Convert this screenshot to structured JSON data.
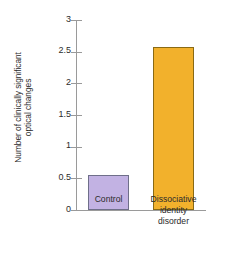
{
  "chart_data": {
    "type": "bar",
    "title": "",
    "subtitle": "",
    "xlabel": "",
    "ylabel": "Number of clinically significant optical changes",
    "ylabel_lines": [
      "Number of clinically significant",
      "optical changes"
    ],
    "categories": [
      "Control",
      "Dissociative identity disorder"
    ],
    "category_label_lines": [
      [
        "Control"
      ],
      [
        "Dissociative",
        "identity",
        "disorder"
      ]
    ],
    "values": [
      0.55,
      2.57
    ],
    "ylim": [
      0,
      3
    ],
    "yticks": [
      0,
      0.5,
      1,
      1.5,
      2,
      2.5,
      3
    ],
    "ytick_labels": [
      "0",
      "0.5",
      "1",
      "1.5",
      "2",
      "2.5",
      "3"
    ],
    "grid": false,
    "legend": false,
    "legend_position": "none",
    "bar_colors": [
      "#c2b2e3",
      "#f2b12c"
    ],
    "bar_edge_colors": [
      "#6f6f8a",
      "#8a6a14"
    ],
    "axis_color": "#9a9a9a",
    "text_color": "#2b2b2b",
    "background_color": "#ffffff"
  }
}
